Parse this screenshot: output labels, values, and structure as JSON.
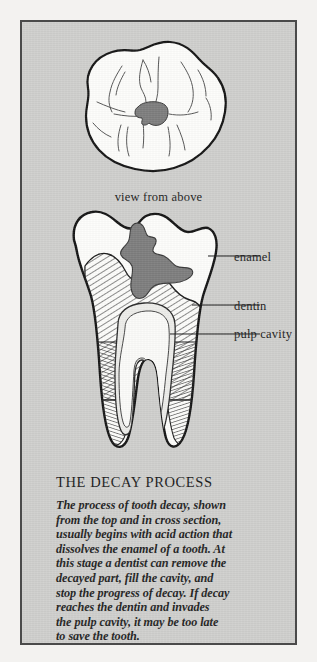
{
  "plate": {
    "background_color": "#cfcfcd",
    "border_color": "#4a4a4a",
    "page_color": "#f3f2f0"
  },
  "figures": {
    "top_view": {
      "caption": "view from above",
      "enamel_color": "#fdfdfb",
      "outline_color": "#141414",
      "cavity_color": "#7d7d7d"
    },
    "cross_section": {
      "enamel_color": "#fdfdfb",
      "dentin_hatch_color": "#2a2a2a",
      "decay_color": "#7d7d7d",
      "pulp_color": "#ededea",
      "outline_color": "#141414"
    }
  },
  "labels": {
    "enamel": "enamel",
    "dentin": "dentin",
    "pulp_cavity": "pulp cavity"
  },
  "text_block": {
    "title": "THE DECAY PROCESS",
    "lines": [
      "The process of tooth decay, shown",
      "from the top and in cross section,",
      "usually begins with acid action that",
      "dissolves the enamel of a tooth. At",
      "this stage a dentist can remove the",
      "decayed part, fill the cavity, and",
      "stop the progress of decay. If decay",
      "reaches the dentin and invades",
      "the pulp cavity, it may be too late",
      "to save the tooth."
    ]
  }
}
